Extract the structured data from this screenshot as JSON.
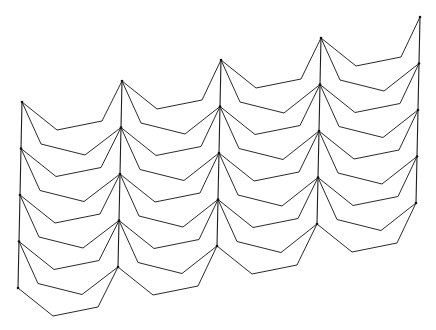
{
  "figure": {
    "width": 436,
    "height": 330,
    "stroke_color": "#2a2a2a",
    "background": "#ffffff"
  },
  "geometry": {
    "columns": [
      {
        "x": 22,
        "y0": 102
      },
      {
        "x": 122,
        "y0": 81
      },
      {
        "x": 221,
        "y0": 60
      },
      {
        "x": 321,
        "y0": 38
      },
      {
        "x": 420,
        "y0": 17
      }
    ],
    "rows": 5,
    "row_step_y": 46.5,
    "row_step_x": -1,
    "upper_fold": {
      "p1": [
        35,
        28
      ],
      "p2": [
        80,
        19
      ]
    },
    "lower_fold": {
      "p1": [
        19,
        42
      ],
      "p2": [
        63,
        53
      ]
    }
  }
}
